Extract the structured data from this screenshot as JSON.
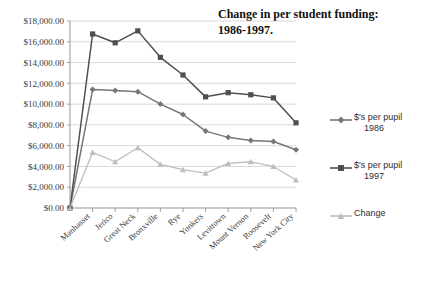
{
  "chart_data": {
    "type": "line",
    "title": "Change in per student funding: 1986-1997.",
    "title_line1": "Change in per student funding:",
    "title_line2": "1986-1997.",
    "xlabel": "",
    "ylabel": "",
    "ylim": [
      0,
      18000
    ],
    "ytick_step": 2000,
    "grid": true,
    "legend_position": "right",
    "categories": [
      "Manhasset",
      "Jerico",
      "Great Neck",
      "Bronxville",
      "Rye",
      "Yonkers",
      "Levittown",
      "Mount Vernon",
      "Roosevelt",
      "New York City"
    ],
    "ytick_labels": [
      "$0.00",
      "$2,000.00",
      "$4,000.00",
      "$6,000.00",
      "$8,000.00",
      "$10,000.00",
      "$12,000.00",
      "$14,000.00",
      "$16,000.00",
      "$18,000.00"
    ],
    "origin_value": 0,
    "series": [
      {
        "name": "$'s per pupil 1986",
        "label_line1": "$'s per pupil",
        "label_line2": "1986",
        "color": "#767676",
        "marker": "diamond",
        "values": [
          11400,
          11300,
          11200,
          10000,
          9000,
          7400,
          6800,
          6500,
          6400,
          5600
        ]
      },
      {
        "name": "$'s per pupil 1997",
        "label_line1": "$'s per pupil",
        "label_line2": "1997",
        "color": "#4f4f4f",
        "marker": "square",
        "values": [
          16750,
          15900,
          17050,
          14500,
          12800,
          10700,
          11100,
          10900,
          10600,
          8200
        ]
      },
      {
        "name": "Change",
        "label_line1": "Change",
        "label_line2": "",
        "color": "#bdbdbd",
        "marker": "triangle",
        "values": [
          5350,
          4450,
          5800,
          4200,
          3700,
          3350,
          4300,
          4450,
          4000,
          2700
        ]
      }
    ]
  },
  "axes": {
    "y_axis_name": "funding-dollars",
    "x_axis_name": "school-district"
  }
}
